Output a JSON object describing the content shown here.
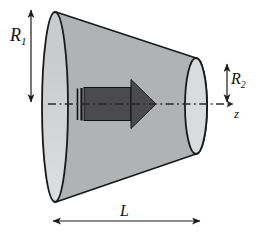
{
  "figure": {
    "labels": {
      "radius_left": {
        "base": "R",
        "sub": "1"
      },
      "radius_right": {
        "base": "R",
        "sub": "2"
      },
      "length": "L",
      "axis": "z"
    },
    "colors": {
      "background": "#ffffff",
      "outline": "#1a1a1a",
      "body": "#b1b2b4",
      "left_face": "#c9cbcd",
      "right_face": "#dadbdc",
      "flow_arrow": "#4b4b4d",
      "flow_arrow_outline": "#111111",
      "centerline": "#2a2a2a",
      "dimension": "#1a1a1a"
    }
  }
}
